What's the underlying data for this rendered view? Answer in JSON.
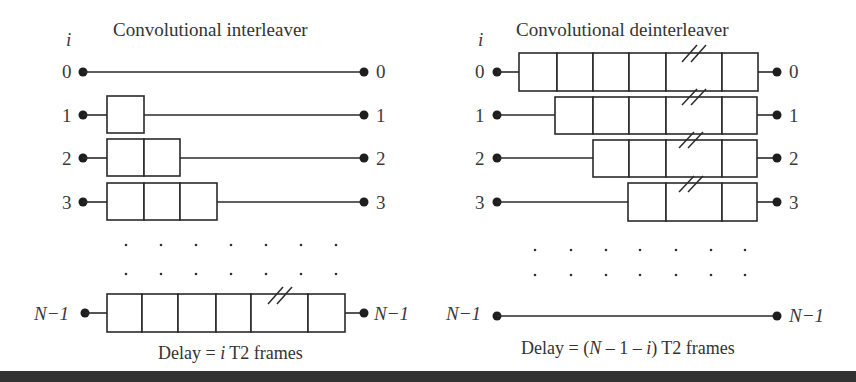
{
  "interleaver": {
    "title": "Convolutional interleaver",
    "index_symbol": "i",
    "rows": [
      {
        "in_label": "0",
        "out_label": "0",
        "cells": 0,
        "broken": false
      },
      {
        "in_label": "1",
        "out_label": "1",
        "cells": 1,
        "broken": false
      },
      {
        "in_label": "2",
        "out_label": "2",
        "cells": 2,
        "broken": false
      },
      {
        "in_label": "3",
        "out_label": "3",
        "cells": 3,
        "broken": false
      },
      {
        "in_label": "N−1",
        "out_label": "N−1",
        "cells": 6,
        "broken": true
      }
    ],
    "caption_prefix": "Delay = ",
    "caption_var": "i",
    "caption_suffix": " T2 frames"
  },
  "deinterleaver": {
    "title": "Convolutional deinterleaver",
    "index_symbol": "i",
    "rows": [
      {
        "in_label": "0",
        "out_label": "0",
        "cells": 6,
        "broken": true
      },
      {
        "in_label": "1",
        "out_label": "1",
        "cells": 5,
        "broken": true
      },
      {
        "in_label": "2",
        "out_label": "2",
        "cells": 4,
        "broken": true
      },
      {
        "in_label": "3",
        "out_label": "3",
        "cells": 3,
        "broken": true
      },
      {
        "in_label": "N−1",
        "out_label": "N−1",
        "cells": 0,
        "broken": false
      }
    ],
    "caption_prefix": "Delay = (",
    "caption_var_n": "N",
    "caption_mid": " – 1 – ",
    "caption_var": "i",
    "caption_suffix": ") T2 frames"
  },
  "ellipsis": "· · · · · · ·",
  "colors": {
    "ink": "#2a2a2a",
    "background": "#ffffff",
    "bottom_bar": "#333333"
  }
}
